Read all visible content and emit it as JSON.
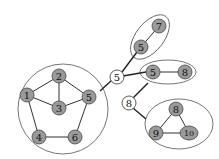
{
  "diagram": {
    "colors": {
      "gray_node": "#9a9a9a",
      "white_node": "#ffffff",
      "edge": "#333333",
      "group_outline": "#666666"
    },
    "clusters": [
      {
        "id": "pentagon",
        "shape": "circle",
        "nodes": [
          {
            "label": "1"
          },
          {
            "label": "2"
          },
          {
            "label": "3"
          },
          {
            "label": "4"
          },
          {
            "label": "5"
          },
          {
            "label": "6"
          }
        ],
        "edges": [
          [
            "1",
            "2"
          ],
          [
            "2",
            "3"
          ],
          [
            "1",
            "3"
          ],
          [
            "2",
            "5"
          ],
          [
            "3",
            "5"
          ],
          [
            "1",
            "4"
          ],
          [
            "4",
            "6"
          ],
          [
            "6",
            "5"
          ]
        ]
      },
      {
        "id": "pair-top",
        "shape": "ellipse",
        "nodes": [
          {
            "label": "7"
          },
          {
            "label": "5"
          }
        ],
        "edges": [
          [
            "5",
            "7"
          ]
        ]
      },
      {
        "id": "pair-right",
        "shape": "ellipse",
        "nodes": [
          {
            "label": "5"
          },
          {
            "label": "8"
          }
        ],
        "edges": [
          [
            "5",
            "8"
          ]
        ]
      },
      {
        "id": "triangle",
        "shape": "ellipse",
        "nodes": [
          {
            "label": "8"
          },
          {
            "label": "9"
          },
          {
            "label": "10"
          }
        ],
        "edges": [
          [
            "8",
            "9"
          ],
          [
            "8",
            "10"
          ],
          [
            "9",
            "10"
          ]
        ]
      }
    ],
    "connectors": [
      {
        "label": "5"
      },
      {
        "label": "8"
      }
    ]
  }
}
